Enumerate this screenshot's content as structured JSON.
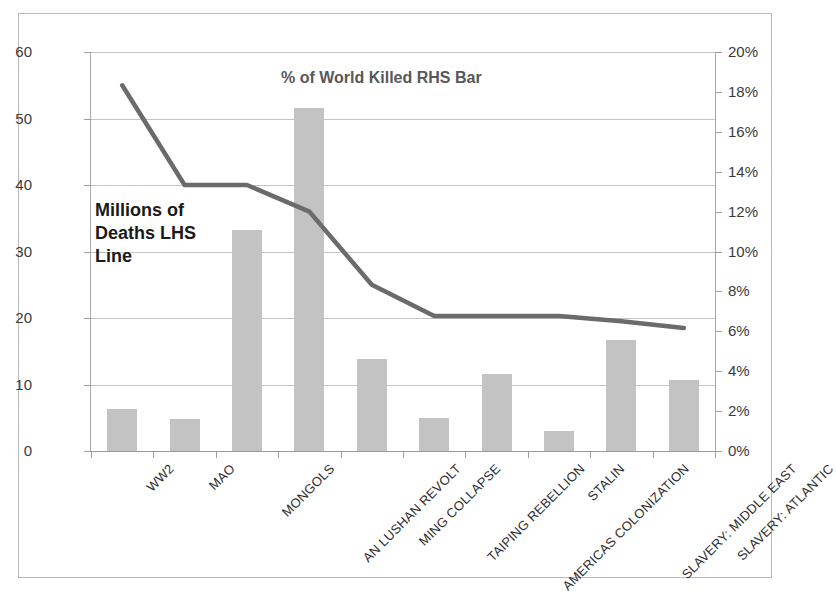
{
  "chart_data": {
    "type": "bar",
    "title": "% of World Killed RHS Bar",
    "annotation": "Millions of Deaths LHS Line",
    "annotation_lines": [
      "Millions of",
      "Deaths LHS",
      "Line"
    ],
    "xlabel": "",
    "ylabel": "",
    "grid": true,
    "legend": "none",
    "categories": [
      "WW2",
      "MAO",
      "MONGOLS",
      "AN LUSHAN REVOLT",
      "MING COLLAPSE",
      "TAIPING REBELLION",
      "AMERICAS COLONIZATION",
      "STALIN",
      "SLAVERY: MIDDLE EAST",
      "SLAVERY: ATLANTIC"
    ],
    "series": [
      {
        "name": "% of World Killed RHS Bar",
        "type": "bar",
        "axis": "right",
        "unit": "%",
        "values": [
          2.1,
          1.6,
          11.1,
          17.2,
          4.6,
          1.65,
          3.85,
          1.0,
          5.55,
          3.55
        ]
      },
      {
        "name": "Millions of Deaths LHS Line",
        "type": "line",
        "axis": "left",
        "unit": "millions",
        "values": [
          55,
          40,
          40,
          36,
          25,
          20.3,
          20.3,
          20.3,
          19.5,
          18.5
        ]
      }
    ],
    "left_axis": {
      "label": "Millions of Deaths LHS Line",
      "min": 0,
      "max": 60,
      "step": 10,
      "ticks": [
        "0",
        "10",
        "20",
        "30",
        "40",
        "50",
        "60"
      ]
    },
    "right_axis": {
      "label": "% of World Killed RHS Bar",
      "min": 0,
      "max": 20,
      "step": 2,
      "ticks": [
        "0%",
        "2%",
        "4%",
        "6%",
        "8%",
        "10%",
        "12%",
        "14%",
        "16%",
        "18%",
        "20%"
      ]
    },
    "colors": {
      "bar": "#c3c3c3",
      "line": "#6b6b6b",
      "grid": "#c4c4c4",
      "axis": "#a8a8a8",
      "text": "#2f2f2f",
      "title": "#585858",
      "frame": "#b9b9b9",
      "background": "#ffffff"
    }
  }
}
